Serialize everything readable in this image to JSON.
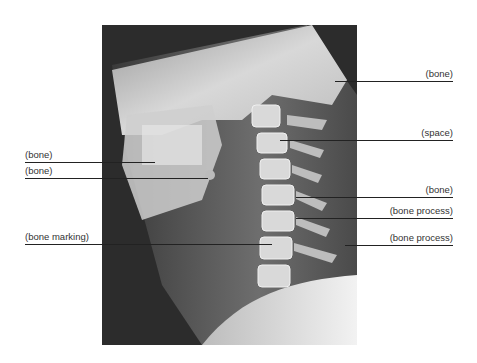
{
  "figure": {
    "image_icon": "xray-image"
  },
  "labels": {
    "right": [
      {
        "text": "(bone)",
        "y": 81
      },
      {
        "text": "(space)",
        "y": 140
      },
      {
        "text": "(bone)",
        "y": 197
      },
      {
        "text": "(bone process)",
        "y": 218
      },
      {
        "text": "(bone process)",
        "y": 245
      }
    ],
    "left": [
      {
        "text": "(bone)",
        "y": 162
      },
      {
        "text": "(bone)",
        "y": 178
      },
      {
        "text": "(bone marking)",
        "y": 244
      }
    ]
  }
}
